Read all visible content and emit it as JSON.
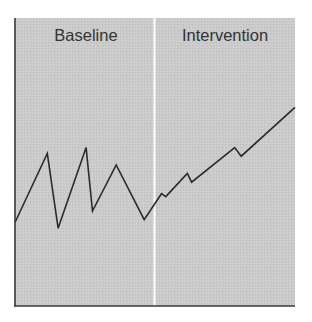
{
  "chart_data": {
    "type": "line",
    "title": "",
    "xlabel": "",
    "ylabel": "",
    "grid": false,
    "legend": "none",
    "phases": [
      {
        "label": "Baseline",
        "x_start": 0,
        "x_end": 6
      },
      {
        "label": "Intervention",
        "x_start": 6,
        "x_end": 13
      }
    ],
    "phase_change_line_x": 6,
    "series": [
      {
        "name": "Behavior",
        "points": [
          {
            "x": 0,
            "y": 29
          },
          {
            "x": 1.5,
            "y": 53
          },
          {
            "x": 2,
            "y": 27
          },
          {
            "x": 3.3,
            "y": 55
          },
          {
            "x": 3.6,
            "y": 33
          },
          {
            "x": 4.7,
            "y": 49
          },
          {
            "x": 6,
            "y": 30
          },
          {
            "x": 6.8,
            "y": 39
          },
          {
            "x": 7,
            "y": 38
          },
          {
            "x": 8,
            "y": 46
          },
          {
            "x": 8.2,
            "y": 43
          },
          {
            "x": 10.2,
            "y": 55
          },
          {
            "x": 10.5,
            "y": 52
          },
          {
            "x": 13,
            "y": 69
          }
        ]
      }
    ],
    "xlim": [
      0,
      13
    ],
    "ylim": [
      0,
      100
    ]
  },
  "labels": {
    "baseline": "Baseline",
    "intervention": "Intervention"
  },
  "colors": {
    "panel_fill": "#c9c9c9",
    "line": "#2b2b2b",
    "axis": "#3a3a3a",
    "divider": "#ffffff",
    "text": "#333333"
  }
}
